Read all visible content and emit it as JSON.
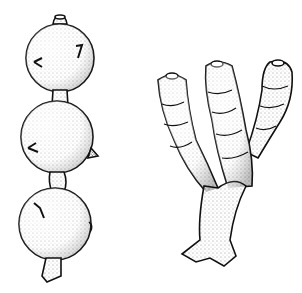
{
  "figure": {
    "background": "#ffffff",
    "ink_color": "#111111",
    "style": "stipple-illustration",
    "specimens": [
      {
        "id": "left",
        "description": "chain of three spherical chambers with short neck and apertures"
      },
      {
        "id": "right",
        "description": "branching tubular form with three branches, each with terminal aperture"
      }
    ]
  }
}
